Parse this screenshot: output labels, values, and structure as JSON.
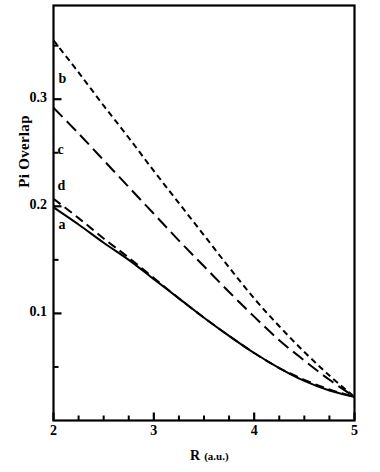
{
  "chart_data": {
    "type": "line",
    "title": "",
    "xlabel": "R (a.u.)",
    "xlabel_main": "R",
    "xlabel_unit": "(a.u.)",
    "ylabel": "Pi Overlap",
    "xlim": [
      2,
      5
    ],
    "ylim": [
      0,
      0.3875
    ],
    "grid": false,
    "legend": "inline-labels",
    "xticks_major": [
      2,
      3,
      4,
      5
    ],
    "xticks_major_labels": [
      "2",
      "3",
      "4",
      "5"
    ],
    "xticks_minor": [
      2.25,
      2.5,
      2.75,
      3.25,
      3.5,
      3.75,
      4.25,
      4.5,
      4.75
    ],
    "yticks_major": [
      0.1,
      0.2,
      0.3
    ],
    "yticks_major_labels": [
      "0.1",
      "0.2",
      "0.3"
    ],
    "yticks_minor": [
      0.05,
      0.15,
      0.25,
      0.35
    ],
    "series": [
      {
        "name": "b",
        "label": "b",
        "style": "short-dash",
        "color": "#000000",
        "x": [
          2.0,
          2.25,
          2.5,
          2.75,
          3.0,
          3.25,
          3.5,
          3.75,
          4.0,
          4.25,
          4.5,
          4.75,
          5.0
        ],
        "values": [
          0.355,
          0.325,
          0.294,
          0.264,
          0.233,
          0.203,
          0.173,
          0.143,
          0.114,
          0.088,
          0.064,
          0.042,
          0.022
        ]
      },
      {
        "name": "c",
        "label": "c",
        "style": "long-dash",
        "color": "#000000",
        "x": [
          2.0,
          2.25,
          2.5,
          2.75,
          3.0,
          3.25,
          3.5,
          3.75,
          4.0,
          4.25,
          4.5,
          4.75,
          5.0
        ],
        "values": [
          0.292,
          0.268,
          0.243,
          0.218,
          0.193,
          0.168,
          0.144,
          0.12,
          0.097,
          0.075,
          0.056,
          0.038,
          0.022
        ]
      },
      {
        "name": "d",
        "label": "d",
        "style": "medium-dash",
        "color": "#000000",
        "x": [
          2.0,
          2.25,
          2.5,
          2.75,
          3.0,
          3.25,
          3.5,
          3.75,
          4.0,
          4.25,
          4.5,
          4.75,
          5.0
        ],
        "values": [
          0.207,
          0.189,
          0.17,
          0.152,
          0.133,
          0.114,
          0.096,
          0.079,
          0.063,
          0.049,
          0.038,
          0.029,
          0.022
        ]
      },
      {
        "name": "a",
        "label": "a",
        "style": "solid",
        "color": "#000000",
        "x": [
          2.0,
          2.25,
          2.5,
          2.75,
          3.0,
          3.25,
          3.5,
          3.75,
          4.0,
          4.25,
          4.5,
          4.75,
          5.0
        ],
        "values": [
          0.199,
          0.183,
          0.166,
          0.15,
          0.132,
          0.114,
          0.096,
          0.079,
          0.063,
          0.049,
          0.037,
          0.028,
          0.022
        ]
      }
    ],
    "annotations": [
      {
        "text": "b",
        "x": 2.05,
        "y": 0.318
      },
      {
        "text": "c",
        "x": 2.04,
        "y": 0.252
      },
      {
        "text": "d",
        "x": 2.04,
        "y": 0.218
      },
      {
        "text": "a",
        "x": 2.05,
        "y": 0.182
      }
    ]
  }
}
